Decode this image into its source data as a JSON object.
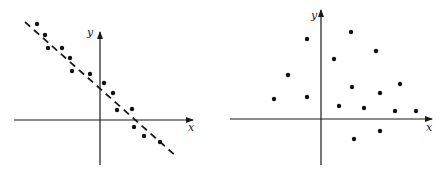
{
  "chart_data": [
    {
      "type": "scatter",
      "title": "",
      "xlabel": "x",
      "ylabel": "y",
      "grid": false,
      "description": "Strong negative linear correlation with dashed regression line",
      "origin_px": [
        100,
        120
      ],
      "x_axis_px": [
        14,
        193
      ],
      "y_axis_px": [
        32,
        165
      ],
      "trend_line_px": [
        [
          25,
          22
        ],
        [
          177,
          157
        ]
      ],
      "points_px": [
        [
          37,
          24
        ],
        [
          45,
          35
        ],
        [
          48,
          48
        ],
        [
          62,
          48
        ],
        [
          70,
          58
        ],
        [
          72,
          71
        ],
        [
          90,
          74
        ],
        [
          104,
          83
        ],
        [
          113,
          93
        ],
        [
          117,
          110
        ],
        [
          132,
          109
        ],
        [
          134,
          127
        ],
        [
          144,
          136
        ],
        [
          160,
          142
        ]
      ]
    },
    {
      "type": "scatter",
      "title": "",
      "xlabel": "x",
      "ylabel": "y",
      "grid": false,
      "description": "No correlation, scattered points",
      "origin_px": [
        321,
        119
      ],
      "x_axis_px": [
        230,
        432
      ],
      "y_axis_px": [
        10,
        165
      ],
      "points_px": [
        [
          274,
          99
        ],
        [
          288,
          75
        ],
        [
          307,
          39
        ],
        [
          307,
          97
        ],
        [
          334,
          59
        ],
        [
          351,
          32
        ],
        [
          339,
          106
        ],
        [
          352,
          87
        ],
        [
          364,
          108
        ],
        [
          376,
          51
        ],
        [
          380,
          93
        ],
        [
          400,
          84
        ],
        [
          395,
          111
        ],
        [
          416,
          111
        ],
        [
          354,
          139
        ],
        [
          380,
          131
        ]
      ]
    }
  ],
  "labels": {
    "left_x": "x",
    "left_y": "y",
    "right_x": "x",
    "right_y": "y"
  }
}
